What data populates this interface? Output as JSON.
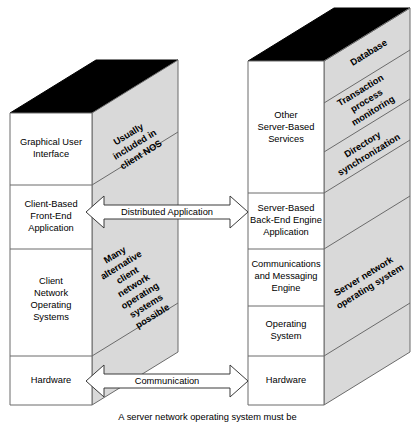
{
  "diagram": {
    "colors": {
      "front_face": "#ffffff",
      "side_face": "#d9d9d9",
      "top_face": "#000000",
      "outline": "#6b6b6b",
      "text": "#000000"
    },
    "client_block": {
      "name": "Client",
      "front_layers": [
        {
          "label": "Graphical User\nInterface",
          "lines": [
            "Graphical User",
            "Interface"
          ]
        },
        {
          "label": "Client-Based\nFront-End\nApplication",
          "lines": [
            "Client-Based",
            "Front-End",
            "Application"
          ]
        },
        {
          "label": "Client\nNetwork\nOperating\nSystems",
          "lines": [
            "Client",
            "Network",
            "Operating",
            "Systems"
          ]
        },
        {
          "label": "Hardware",
          "lines": [
            "Hardware"
          ]
        }
      ],
      "side_layers": [
        {
          "label": "Usually included in client NOS",
          "lines": [
            "Usually",
            "included in",
            "client NOS"
          ]
        },
        {
          "label": "Many alternative client network operating systems possible",
          "lines": [
            "Many",
            "alternative",
            "client",
            "network",
            "operating",
            "systems",
            "possible"
          ]
        },
        {
          "label": "",
          "lines": []
        }
      ]
    },
    "server_block": {
      "name": "Server",
      "front_layers": [
        {
          "label": "Other\nServer-Based\nServices",
          "lines": [
            "Other",
            "Server-Based",
            "Services"
          ]
        },
        {
          "label": "Server-Based\nBack-End Engine\nApplication",
          "lines": [
            "Server-Based",
            "Back-End Engine",
            "Application"
          ]
        },
        {
          "label": "Communications\nand Messaging\nEngine",
          "lines": [
            "Communications",
            "and Messaging",
            "Engine"
          ]
        },
        {
          "label": "Operating\nSystem",
          "lines": [
            "Operating",
            "System"
          ]
        },
        {
          "label": "Hardware",
          "lines": [
            "Hardware"
          ]
        }
      ],
      "side_layers": [
        {
          "label": "Database",
          "lines": [
            "Database"
          ]
        },
        {
          "label": "Transaction process monitoring",
          "lines": [
            "Transaction",
            "process",
            "monitoring"
          ]
        },
        {
          "label": "Directory synchronization",
          "lines": [
            "Directory",
            "synchronization"
          ]
        },
        {
          "label": "Server network operating system",
          "lines": [
            "Server network",
            "operating system"
          ]
        },
        {
          "label": "",
          "lines": []
        }
      ]
    },
    "connectors": [
      {
        "label": "Distributed Application",
        "style": "double-headed-arrow"
      },
      {
        "label": "Communication",
        "style": "double-headed-arrow"
      }
    ],
    "caption": "A server network operating system must be"
  }
}
